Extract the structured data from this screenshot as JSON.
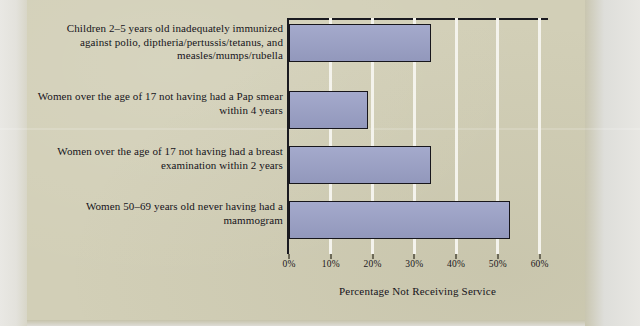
{
  "chart_data": {
    "type": "bar",
    "orientation": "horizontal",
    "title": "",
    "xlabel": "Percentage Not Receiving Service",
    "ylabel": "",
    "xlim": [
      0,
      62
    ],
    "xticks": [
      0,
      10,
      20,
      30,
      40,
      50,
      60
    ],
    "xtick_labels": [
      "0%",
      "10%",
      "20%",
      "30%",
      "40%",
      "50%",
      "60%"
    ],
    "grid": "vertical-white",
    "legend": "none",
    "categories": [
      "Children 2–5 years old inadequately immunized against polio, diptheria/pertussis/tetanus, and measles/mumps/rubella",
      "Women over the age of 17 not having had a Pap smear within 4 years",
      "Women over the age of 17 not having had a breast examination within 2 years",
      "Women 50–69 years old never having had a mammogram"
    ],
    "values": [
      34,
      18.8,
      34,
      52.8
    ],
    "bar_color": "#9aa0c6",
    "bar_edge_color": "#17161c",
    "plot_background": "#d2cfb7"
  },
  "colors": {
    "page_background": "#d2cfb7",
    "bar_fill": "#9aa0c6",
    "bar_edge": "#17161c",
    "gridline": "#f4f3ec",
    "text": "#15131a"
  }
}
